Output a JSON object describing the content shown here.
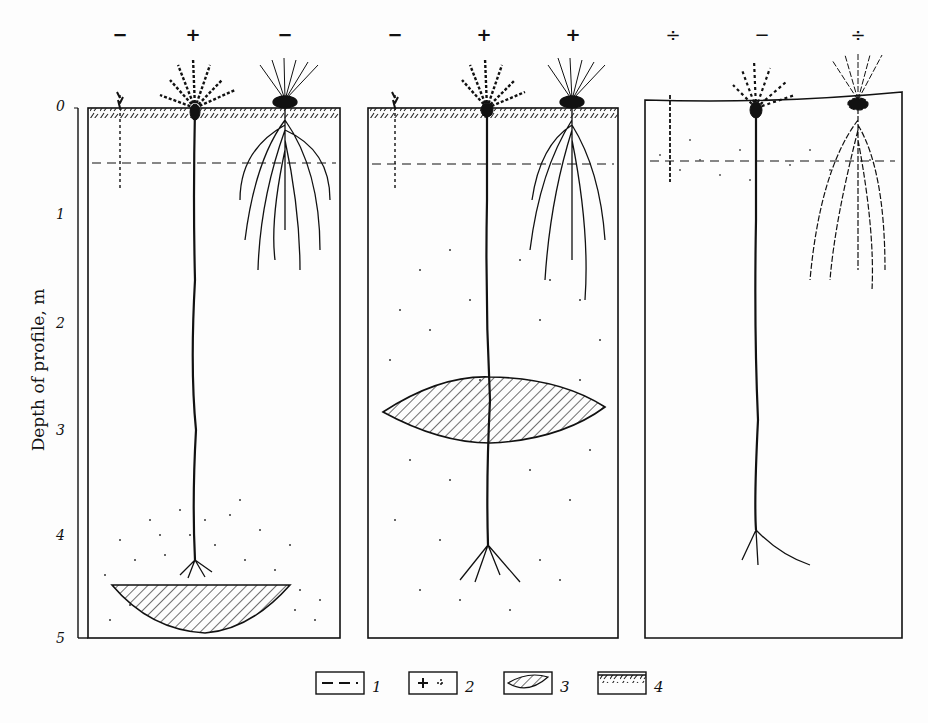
{
  "figure": {
    "y_axis": {
      "label": "Depth of profile, m",
      "ticks": [
        "0",
        "1",
        "2",
        "3",
        "4",
        "5"
      ],
      "range_m": [
        0,
        5
      ]
    },
    "panels": [
      {
        "id": "panel-1",
        "plant_signs": [
          "−",
          "+",
          "−"
        ],
        "plants": [
          {
            "type": "small-shallow",
            "sign": "−",
            "root_depth_m": 0.75
          },
          {
            "type": "taproot-deep",
            "sign": "+",
            "root_depth_m": 4.3
          },
          {
            "type": "fibrous-spreading",
            "sign": "−",
            "root_depth_m": 1.5
          }
        ],
        "dashed_line_depth_m": 0.5,
        "lens": {
          "shape": "bowl",
          "top_m": 4.5,
          "bottom_m": 4.95
        },
        "stipple_zone_m": [
          3.7,
          5.0
        ]
      },
      {
        "id": "panel-2",
        "plant_signs": [
          "−",
          "+",
          "+"
        ],
        "plants": [
          {
            "type": "small-shallow",
            "sign": "−",
            "root_depth_m": 0.75
          },
          {
            "type": "taproot-deep",
            "sign": "+",
            "root_depth_m": 4.5
          },
          {
            "type": "fibrous-spreading",
            "sign": "+",
            "root_depth_m": 1.9
          }
        ],
        "dashed_line_depth_m": 0.5,
        "lens": {
          "shape": "lenticular",
          "top_m": 2.55,
          "bottom_m": 3.15
        },
        "stipple_zone_m": [
          1.3,
          4.7
        ]
      },
      {
        "id": "panel-3",
        "plant_signs": [
          "÷",
          "−",
          "÷"
        ],
        "plants": [
          {
            "type": "small-shallow",
            "sign": "÷",
            "root_depth_m": 0.7
          },
          {
            "type": "taproot-deep",
            "sign": "−",
            "root_depth_m": 4.4
          },
          {
            "type": "fibrous-spreading",
            "sign": "÷",
            "root_depth_m": 1.7
          }
        ],
        "dashed_line_depth_m": 0.5,
        "lens": null,
        "stipple_zone_m": [
          0.3,
          0.8
        ]
      }
    ],
    "legend": [
      {
        "num": "1",
        "symbol": "dashed-line"
      },
      {
        "num": "2",
        "symbol": "plus-signs"
      },
      {
        "num": "3",
        "symbol": "hatched-lens"
      },
      {
        "num": "4",
        "symbol": "hatched-surface-layer"
      }
    ]
  }
}
